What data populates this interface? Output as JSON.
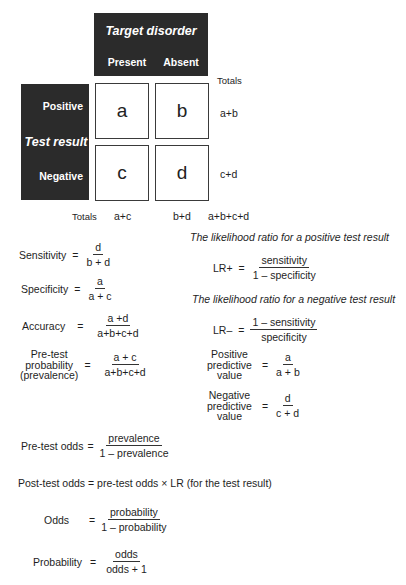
{
  "table": {
    "column_header": {
      "title": "Target disorder",
      "columns": [
        "Present",
        "Absent"
      ]
    },
    "row_header": {
      "title": "Test result",
      "rows": [
        "Positive",
        "Negative"
      ]
    },
    "cells": {
      "a": "a",
      "b": "b",
      "c": "c",
      "d": "d"
    },
    "totals_label_right": "Totals",
    "row_totals": [
      "a+b",
      "c+d"
    ],
    "totals_label_bottom": "Totals",
    "column_totals": [
      "a+c",
      "b+d"
    ],
    "grand_total": "a+b+c+d"
  },
  "formulas_left": [
    {
      "label": "Sensitivity",
      "eq": "=",
      "numerator": "d",
      "denominator": "b + d"
    },
    {
      "label": "Specificity",
      "eq": "=",
      "numerator": "a",
      "denominator": "a + c"
    },
    {
      "label": "Accuracy",
      "eq": "=",
      "numerator": "a +d",
      "denominator": "a+b+c+d"
    },
    {
      "label_lines": [
        "Pre-test",
        "probability",
        "(prevalence)"
      ],
      "eq": "=",
      "numerator": "a + c",
      "denominator": "a+b+c+d"
    }
  ],
  "formulas_right": {
    "lr_pos_caption": "The likelihood ratio for a positive test result",
    "lr_pos": {
      "label": "LR+",
      "eq": "=",
      "numerator": "sensitivity",
      "denominator": "1 – specificity"
    },
    "lr_neg_caption": "The likelihood ratio for a negative test result",
    "lr_neg": {
      "label": "LR–",
      "eq": "=",
      "numerator": "1 – sensitivity",
      "denominator": "specificity"
    },
    "ppv": {
      "label_lines": [
        "Positive",
        "predictive",
        "value"
      ],
      "eq": "=",
      "numerator": "a",
      "denominator": "a + b"
    },
    "npv": {
      "label_lines": [
        "Negative",
        "predictive",
        "value"
      ],
      "eq": "=",
      "numerator": "d",
      "denominator": "c + d"
    }
  },
  "formulas_bottom": {
    "pretest_odds": {
      "label": "Pre-test odds",
      "eq": "=",
      "numerator": "prevalence",
      "denominator": "1 – prevalence"
    },
    "posttest_odds": "Post-test odds = pre-test odds × LR (for the test result)",
    "odds": {
      "label": "Odds",
      "eq": "=",
      "numerator": "probability",
      "denominator": "1 – probability"
    },
    "probability": {
      "label": "Probability",
      "eq": "=",
      "numerator": "odds",
      "denominator": "odds + 1"
    }
  }
}
